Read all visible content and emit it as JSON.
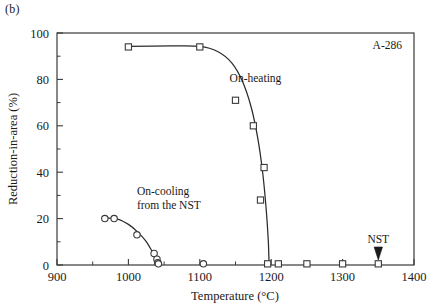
{
  "figure": {
    "panel_label": "(b)",
    "sample_id": "A-286"
  },
  "chart_data": {
    "type": "scatter",
    "title": "",
    "xlabel": "Temperature (°C)",
    "ylabel": "Reduction-in-area (%)",
    "xlim": [
      900,
      1400
    ],
    "ylim": [
      0,
      100
    ],
    "xticks": [
      900,
      1000,
      1100,
      1200,
      1300,
      1400
    ],
    "xtick_labels": [
      "900",
      "1000",
      "1100",
      "1200",
      "1300",
      "1400"
    ],
    "x_minor_step": 50,
    "yticks": [
      0,
      20,
      40,
      60,
      80,
      100
    ],
    "ytick_labels": [
      "0",
      "20",
      "40",
      "60",
      "80",
      "100"
    ],
    "y_minor_step": 10,
    "grid": false,
    "legend_position": "none",
    "series": [
      {
        "name": "On-heating",
        "marker": "square",
        "marker_filled": false,
        "label": "On-heating",
        "label_x": 1178,
        "label_y": 79,
        "points": [
          {
            "x": 1000,
            "y": 94
          },
          {
            "x": 1100,
            "y": 94
          },
          {
            "x": 1150,
            "y": 71
          },
          {
            "x": 1175,
            "y": 60
          },
          {
            "x": 1190,
            "y": 42
          },
          {
            "x": 1185,
            "y": 28
          },
          {
            "x": 1195,
            "y": 0.5
          },
          {
            "x": 1210,
            "y": 0.5
          },
          {
            "x": 1250,
            "y": 0.5
          },
          {
            "x": 1300,
            "y": 0.5
          },
          {
            "x": 1350,
            "y": 0.5
          }
        ],
        "curve": [
          {
            "x": 1000,
            "y": 94.2
          },
          {
            "x": 1060,
            "y": 94.4
          },
          {
            "x": 1100,
            "y": 94.2
          },
          {
            "x": 1125,
            "y": 92.0
          },
          {
            "x": 1145,
            "y": 87.0
          },
          {
            "x": 1160,
            "y": 79.0
          },
          {
            "x": 1172,
            "y": 68.0
          },
          {
            "x": 1181,
            "y": 55.0
          },
          {
            "x": 1188,
            "y": 40.0
          },
          {
            "x": 1193,
            "y": 24.0
          },
          {
            "x": 1196,
            "y": 10.0
          },
          {
            "x": 1197,
            "y": 0.0
          }
        ]
      },
      {
        "name": "On-cooling from the NST",
        "marker": "circle",
        "marker_filled": false,
        "label": "On-cooling\nfrom the NST",
        "label_line1": "On-cooling",
        "label_line2": "from the NST",
        "label_x": 1012,
        "label_y": 30,
        "points": [
          {
            "x": 967,
            "y": 20
          },
          {
            "x": 980,
            "y": 20
          },
          {
            "x": 1012,
            "y": 13
          },
          {
            "x": 1036,
            "y": 5
          },
          {
            "x": 1040,
            "y": 2.5
          },
          {
            "x": 1041,
            "y": 1
          },
          {
            "x": 1042,
            "y": 0.5
          },
          {
            "x": 1105,
            "y": 0.5
          }
        ],
        "curve": [
          {
            "x": 967,
            "y": 20.2
          },
          {
            "x": 985,
            "y": 19.8
          },
          {
            "x": 1000,
            "y": 17.5
          },
          {
            "x": 1012,
            "y": 14.5
          },
          {
            "x": 1024,
            "y": 10.5
          },
          {
            "x": 1033,
            "y": 6.0
          },
          {
            "x": 1039,
            "y": 2.5
          },
          {
            "x": 1043,
            "y": 0.0
          }
        ]
      }
    ],
    "annotations": [
      {
        "name": "nst-marker",
        "label": "NST",
        "x": 1350,
        "y": 0,
        "label_offset_y": 14,
        "arrow": "down-triangle"
      }
    ]
  },
  "colors": {
    "axis": "#3a3a3a",
    "curve": "#2b2b2b",
    "marker_stroke": "#3a3a3a",
    "marker_fill": "#ffffff",
    "text": "#1a1a1a",
    "background": "#ffffff"
  }
}
